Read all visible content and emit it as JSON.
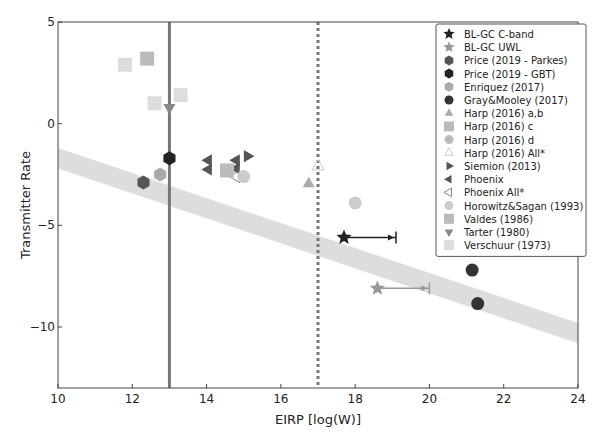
{
  "chart_data": {
    "type": "scatter",
    "title": "",
    "xlabel": "EIRP [log(W)]",
    "ylabel": "Transmitter Rate",
    "xlim": [
      10,
      24
    ],
    "ylim": [
      -13,
      5
    ],
    "xticks": [
      10,
      12,
      14,
      16,
      18,
      20,
      22,
      24
    ],
    "yticks": [
      5,
      0,
      -5,
      -10
    ],
    "grid": false,
    "legend_position": "upper right",
    "vlines": [
      {
        "x": 13.0,
        "style": "solid",
        "color": "#777777"
      },
      {
        "x": 17.0,
        "style": "dotted",
        "color": "#777777"
      }
    ],
    "band": {
      "x": [
        10,
        24
      ],
      "y_center": [
        -1.7,
        -10.3
      ],
      "half_width": 0.5,
      "color": "#dddddd"
    },
    "series": [
      {
        "name": "BL-GC C-band",
        "marker": "star",
        "color": "#222222",
        "points": [
          [
            17.7,
            -5.6
          ]
        ],
        "arrow_to": 19.1
      },
      {
        "name": "BL-GC UWL",
        "marker": "star",
        "color": "#999999",
        "points": [
          [
            18.6,
            -8.1
          ]
        ],
        "arrow_to": 20.0
      },
      {
        "name": "Price (2019 - Parkes)",
        "marker": "hexagon",
        "color": "#555555",
        "points": [
          [
            12.3,
            -2.9
          ]
        ]
      },
      {
        "name": "Price (2019 - GBT)",
        "marker": "hexagon",
        "color": "#222222",
        "points": [
          [
            13.0,
            -1.7
          ]
        ]
      },
      {
        "name": "Enriquez (2017)",
        "marker": "hexagon",
        "color": "#aaaaaa",
        "points": [
          [
            12.75,
            -2.5
          ]
        ]
      },
      {
        "name": "Gray&Mooley (2017)",
        "marker": "circle",
        "color": "#333333",
        "points": [
          [
            21.15,
            -7.2
          ],
          [
            21.3,
            -8.85
          ]
        ]
      },
      {
        "name": "Harp (2016) a,b",
        "marker": "triangle-up",
        "color": "#aaaaaa",
        "points": [
          [
            16.75,
            -2.95
          ]
        ]
      },
      {
        "name": "Harp (2016) c",
        "marker": "square",
        "color": "#bbbbbb",
        "points": []
      },
      {
        "name": "Harp (2016) d",
        "marker": "circle",
        "color": "#bbbbbb",
        "points": []
      },
      {
        "name": "Harp (2016) All*",
        "marker": "triangle-up-open",
        "color": "#cccccc",
        "points": [
          [
            17.0,
            -2.1
          ]
        ]
      },
      {
        "name": "Siemion (2013)",
        "marker": "triangle-right",
        "color": "#555555",
        "points": [
          [
            15.1,
            -1.6
          ]
        ]
      },
      {
        "name": "Phoenix",
        "marker": "triangle-left",
        "color": "#555555",
        "points": [
          [
            14.05,
            -1.8
          ],
          [
            14.05,
            -2.25
          ],
          [
            14.8,
            -1.8
          ],
          [
            14.8,
            -2.2
          ]
        ]
      },
      {
        "name": "Phoenix All*",
        "marker": "triangle-left-open",
        "color": "#888888",
        "points": [
          [
            14.8,
            -2.6
          ]
        ]
      },
      {
        "name": "Horowitz&Sagan (1993)",
        "marker": "circle",
        "color": "#cccccc",
        "points": [
          [
            15.0,
            -2.6
          ],
          [
            18.0,
            -3.9
          ]
        ]
      },
      {
        "name": "Valdes (1986)",
        "marker": "square",
        "color": "#bbbbbb",
        "points": [
          [
            14.55,
            -2.3
          ],
          [
            12.4,
            3.2
          ]
        ]
      },
      {
        "name": "Tarter (1980)",
        "marker": "triangle-down",
        "color": "#888888",
        "points": [
          [
            13.0,
            0.8
          ]
        ]
      },
      {
        "name": "Verschuur (1973)",
        "marker": "square",
        "color": "#dddddd",
        "points": [
          [
            11.8,
            2.9
          ],
          [
            12.6,
            1.0
          ],
          [
            13.3,
            1.4
          ]
        ]
      }
    ]
  }
}
